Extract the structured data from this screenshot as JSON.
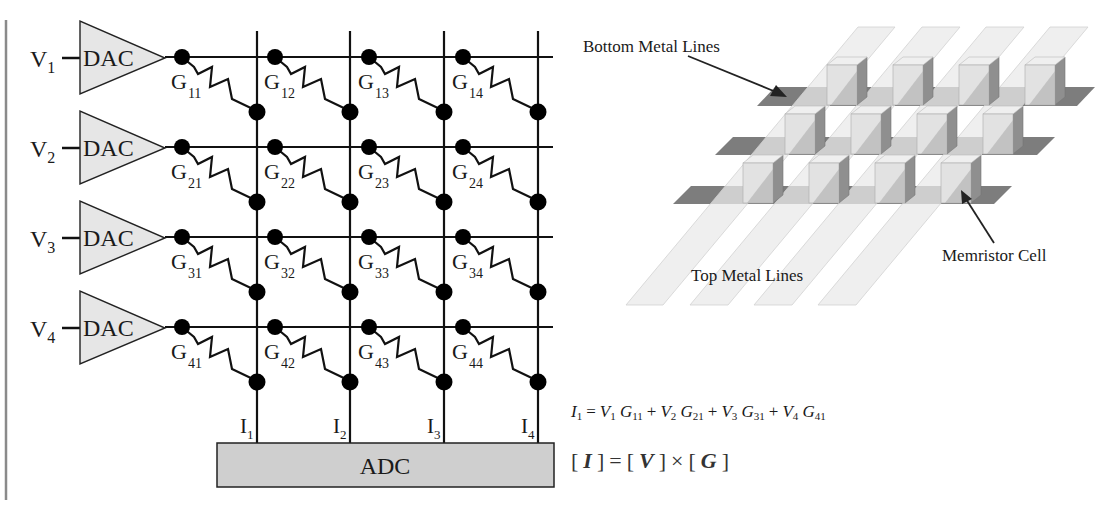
{
  "circuit": {
    "inputs": [
      {
        "label": "V",
        "sub": "1",
        "dac_label": "DAC"
      },
      {
        "label": "V",
        "sub": "2",
        "dac_label": "DAC"
      },
      {
        "label": "V",
        "sub": "3",
        "dac_label": "DAC"
      },
      {
        "label": "V",
        "sub": "4",
        "dac_label": "DAC"
      }
    ],
    "conductances": [
      [
        "11",
        "12",
        "13",
        "14"
      ],
      [
        "21",
        "22",
        "23",
        "24"
      ],
      [
        "31",
        "32",
        "33",
        "34"
      ],
      [
        "41",
        "42",
        "43",
        "44"
      ]
    ],
    "conductance_symbol": "G",
    "outputs": [
      {
        "label": "I",
        "sub": "1"
      },
      {
        "label": "I",
        "sub": "2"
      },
      {
        "label": "I",
        "sub": "3"
      },
      {
        "label": "I",
        "sub": "4"
      }
    ],
    "adc_label": "ADC"
  },
  "crossbar_3d": {
    "bottom_lines_label": "Bottom Metal Lines",
    "top_lines_label": "Top Metal Lines",
    "cell_label": "Memristor Cell",
    "rows": 3,
    "columns": 4
  },
  "equations": {
    "eq1": {
      "lhs": "I",
      "lhs_sub": "1",
      "equals": "=",
      "terms": [
        {
          "v": "V",
          "v_sub": "1",
          "g": "G",
          "g_sub": "11"
        },
        {
          "v": "V",
          "v_sub": "2",
          "g": "G",
          "g_sub": "21"
        },
        {
          "v": "V",
          "v_sub": "3",
          "g": "G",
          "g_sub": "31"
        },
        {
          "v": "V",
          "v_sub": "4",
          "g": "G",
          "g_sub": "41"
        }
      ],
      "plus": "+"
    },
    "eq2": {
      "lb": "[",
      "rb": "]",
      "I": "I",
      "V": "V",
      "G": "G",
      "equals": "=",
      "times": "×"
    }
  },
  "colors": {
    "line": "#111111",
    "dac_fill": "#e6e6e6",
    "adc_fill": "#cfcfcf",
    "top_strip": "#e9e9e9",
    "bottom_strip": "#7d7d7d",
    "cube_front": "#e2e2e2",
    "cube_side": "#8f8f8f",
    "cube_top": "#efefef",
    "frame_line": "#8a8a8a"
  }
}
